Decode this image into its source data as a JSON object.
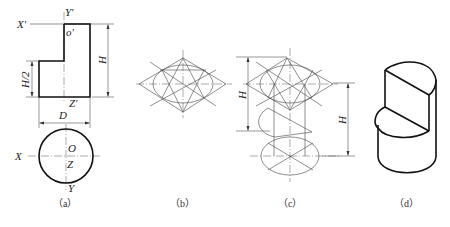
{
  "figure": {
    "panels": [
      {
        "id": "a",
        "caption": "（a）",
        "labels": {
          "x_prime": "X'",
          "y_prime": "Y'",
          "o_prime": "o'",
          "z_prime": "Z'",
          "height": "H",
          "half_height": "H/2",
          "diameter": "D",
          "x": "X",
          "o": "O",
          "z": "Z",
          "y": "Y"
        }
      },
      {
        "id": "b",
        "caption": "（b）"
      },
      {
        "id": "c",
        "caption": "（c）",
        "labels": {
          "height_left": "H",
          "height_right": "H"
        }
      },
      {
        "id": "d",
        "caption": "（d）"
      }
    ]
  }
}
